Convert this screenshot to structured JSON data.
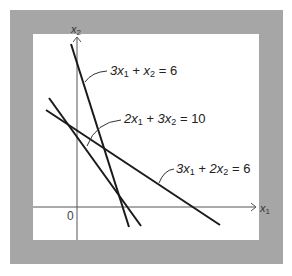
{
  "figure": {
    "frame_color": "#a6a6a6",
    "background": "#ffffff",
    "line_color": "#1a1a1a",
    "axis_color": "#555555"
  },
  "axes": {
    "x_label": "x",
    "x_sub": "1",
    "y_label": "x",
    "y_sub": "2",
    "origin_label": "0"
  },
  "lines": [
    {
      "name": "line-3x1-x2-6",
      "label_a": "3x",
      "label_a_sub": "1",
      "label_mid": " + x",
      "label_mid_sub": "2",
      "label_end": " = 6"
    },
    {
      "name": "line-2x1-3x2-10",
      "label_a": "2x",
      "label_a_sub": "1",
      "label_mid": " + 3x",
      "label_mid_sub": "2",
      "label_end": " = 10"
    },
    {
      "name": "line-3x1-2x2-6",
      "label_a": "3x",
      "label_a_sub": "1",
      "label_mid": " + 2x",
      "label_mid_sub": "2",
      "label_end": " = 6"
    }
  ]
}
